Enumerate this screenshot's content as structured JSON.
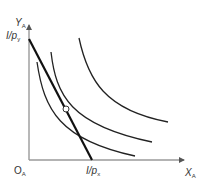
{
  "diagram": {
    "type": "consumer-equilibrium-indifference-curves",
    "axes": {
      "y_label": {
        "main": "Y",
        "sub": "A"
      },
      "x_label": {
        "main": "X",
        "sub": "A"
      },
      "origin_label": {
        "main": "O",
        "sub": "A"
      },
      "axis_color": "#9a9a9a"
    },
    "intercepts": {
      "y_intercept": {
        "main": "I/p",
        "sub": "y"
      },
      "x_intercept": {
        "main": "I/p",
        "sub": "x"
      }
    },
    "budget_line": {
      "label": "budget line",
      "from": [
        29,
        39
      ],
      "to": [
        92,
        160
      ],
      "color": "#111111",
      "width": 2.2
    },
    "indifference_curves": [
      {
        "name": "IC1",
        "path": "M37,62 C44,110 60,140 135,156",
        "color": "#222222"
      },
      {
        "name": "IC2",
        "path": "M51,52 C56,95 70,125 152,142",
        "color": "#222222"
      },
      {
        "name": "IC3",
        "path": "M79,38 C88,80 105,110 168,122",
        "color": "#222222"
      }
    ],
    "equilibrium_point": {
      "label": "tangency",
      "x": 66,
      "y": 109,
      "r": 3,
      "fill": "#ffffff",
      "stroke": "#333333"
    }
  }
}
